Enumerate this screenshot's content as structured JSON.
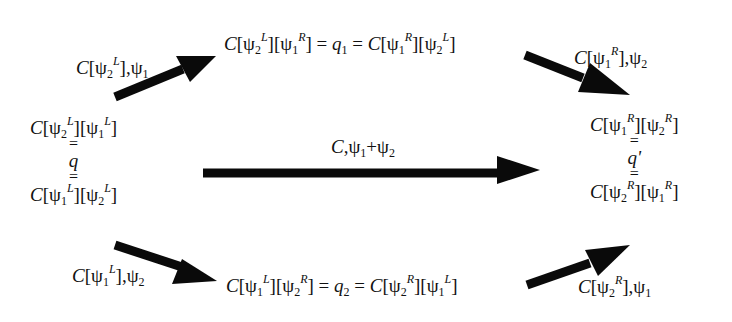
{
  "diagram": {
    "type": "commutative-diagram",
    "nodes": {
      "left": {
        "top": {
          "c": "C",
          "a": "ψ",
          "a_sub": "2",
          "a_sup": "L",
          "b": "ψ",
          "b_sub": "1",
          "b_sup": "L"
        },
        "eq1": "=",
        "q": "q",
        "eq2": "=",
        "bottom": {
          "c": "C",
          "a": "ψ",
          "a_sub": "1",
          "a_sup": "L",
          "b": "ψ",
          "b_sub": "2",
          "b_sup": "L"
        }
      },
      "top_middle": {
        "lhs": {
          "c": "C",
          "a": "ψ",
          "a_sub": "2",
          "a_sup": "L",
          "b": "ψ",
          "b_sub": "1",
          "b_sup": "R"
        },
        "eq": "=",
        "q": "q",
        "q_sub": "1",
        "rhs": {
          "c": "C",
          "a": "ψ",
          "a_sub": "1",
          "a_sup": "R",
          "b": "ψ",
          "b_sub": "2",
          "b_sup": "L"
        }
      },
      "bottom_middle": {
        "lhs": {
          "c": "C",
          "a": "ψ",
          "a_sub": "1",
          "a_sup": "L",
          "b": "ψ",
          "b_sub": "2",
          "b_sup": "R"
        },
        "eq": "=",
        "q": "q",
        "q_sub": "2",
        "rhs": {
          "c": "C",
          "a": "ψ",
          "a_sub": "2",
          "a_sup": "R",
          "b": "ψ",
          "b_sub": "1",
          "b_sup": "L"
        }
      },
      "right": {
        "top": {
          "c": "C",
          "a": "ψ",
          "a_sub": "1",
          "a_sup": "R",
          "b": "ψ",
          "b_sub": "2",
          "b_sup": "R"
        },
        "eq1": "=",
        "q": "q'",
        "eq2": "=",
        "bottom": {
          "c": "C",
          "a": "ψ",
          "a_sub": "2",
          "a_sup": "R",
          "b": "ψ",
          "b_sub": "1",
          "b_sup": "R"
        }
      }
    },
    "edges": {
      "left_to_top": {
        "c": "C",
        "ctx": "ψ",
        "ctx_sub": "2",
        "ctx_sup": "L",
        "arg": "ψ",
        "arg_sub": "1"
      },
      "top_to_right": {
        "c": "C",
        "ctx": "ψ",
        "ctx_sub": "1",
        "ctx_sup": "R",
        "arg": "ψ",
        "arg_sub": "2"
      },
      "left_to_right": {
        "c": "C",
        "a": "ψ",
        "a_sub": "1",
        "plus": "+",
        "b": "ψ",
        "b_sub": "2"
      },
      "left_to_bottom": {
        "c": "C",
        "ctx": "ψ",
        "ctx_sub": "1",
        "ctx_sup": "L",
        "arg": "ψ",
        "arg_sub": "2"
      },
      "bottom_to_right": {
        "c": "C",
        "ctx": "ψ",
        "ctx_sub": "2",
        "ctx_sup": "R",
        "arg": "ψ",
        "arg_sub": "1"
      }
    },
    "arrow_color": "#0a0a0a"
  }
}
